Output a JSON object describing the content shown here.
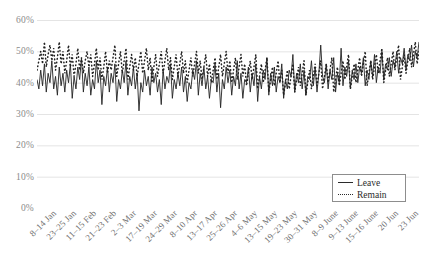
{
  "chart_data": {
    "type": "line",
    "title": "",
    "subtitle": "",
    "xlabel": "",
    "ylabel": "",
    "ylim": [
      0,
      60
    ],
    "y_ticks": [
      "0%",
      "10%",
      "20%",
      "30%",
      "40%",
      "50%",
      "60%"
    ],
    "y_tick_values": [
      0,
      10,
      20,
      30,
      40,
      50,
      60
    ],
    "grid": true,
    "legend_position": "bottom-right",
    "legend": [
      "Leave",
      "Remain"
    ],
    "x_tick_labels": [
      "8–14 Jan",
      "23–25 Jan",
      "11–15 Feb",
      "21–23 Feb",
      "2–3 Mar",
      "17–19 Mar",
      "24–29 Mar",
      "8–10 Apr",
      "13–17 Apr",
      "25–26 Apr",
      "4–6 May",
      "13–15 May",
      "19–23 May",
      "30–31 May",
      "8–9 June",
      "9–13 June",
      "15–16 June",
      "20 Jun",
      "23 Jun"
    ],
    "series": [
      {
        "name": "Leave",
        "style": "solid",
        "color": "#222222",
        "values": [
          41,
          38,
          44,
          39,
          46,
          37,
          43,
          40,
          47,
          38,
          42,
          36,
          45,
          39,
          43,
          37,
          44,
          40,
          46,
          35,
          42,
          38,
          45,
          41,
          48,
          37,
          43,
          39,
          45,
          36,
          41,
          38,
          47,
          40,
          44,
          33,
          42,
          39,
          45,
          37,
          43,
          40,
          46,
          34,
          41,
          38,
          44,
          40,
          47,
          36,
          42,
          39,
          45,
          38,
          43,
          31,
          40,
          37,
          44,
          39,
          42,
          36,
          45,
          40,
          43,
          37,
          41,
          33,
          44,
          38,
          42,
          40,
          46,
          35,
          41,
          38,
          43,
          39,
          45,
          37,
          42,
          34,
          40,
          38,
          44,
          41,
          47,
          36,
          43,
          39,
          45,
          38,
          42,
          35,
          41,
          40,
          46,
          37,
          43,
          32,
          41,
          38,
          45,
          40,
          44,
          36,
          42,
          39,
          47,
          38,
          43,
          35,
          41,
          40,
          45,
          37,
          43,
          39,
          46,
          34,
          42,
          38,
          44,
          41,
          48,
          36,
          43,
          39,
          45,
          37,
          42,
          40,
          46,
          35,
          41,
          38,
          44,
          42,
          49,
          37,
          43,
          40,
          46,
          38,
          44,
          36,
          42,
          41,
          47,
          39,
          45,
          37,
          43,
          52,
          42,
          40,
          46,
          38,
          44,
          41,
          48,
          37,
          43,
          40,
          51,
          39,
          45,
          42,
          47,
          38,
          44,
          41,
          46,
          40,
          45,
          43,
          48,
          39,
          44,
          41,
          47,
          42,
          49,
          40,
          45,
          43,
          50,
          41,
          46,
          44,
          48,
          42,
          47,
          45,
          50,
          43,
          48,
          46,
          51,
          44,
          49,
          47,
          52,
          45,
          50,
          48,
          53
        ]
      },
      {
        "name": "Remain",
        "style": "dotted",
        "color": "#222222",
        "values": [
          44,
          47,
          50,
          46,
          53,
          45,
          49,
          52,
          47,
          51,
          44,
          48,
          53,
          46,
          50,
          43,
          47,
          52,
          45,
          49,
          42,
          46,
          51,
          44,
          48,
          43,
          47,
          50,
          45,
          49,
          42,
          46,
          51,
          44,
          48,
          41,
          45,
          50,
          43,
          47,
          44,
          48,
          52,
          42,
          46,
          50,
          43,
          47,
          51,
          41,
          45,
          49,
          44,
          48,
          42,
          46,
          50,
          43,
          47,
          51,
          44,
          48,
          40,
          45,
          49,
          42,
          46,
          50,
          43,
          47,
          51,
          44,
          48,
          41,
          45,
          49,
          42,
          46,
          50,
          43,
          47,
          40,
          44,
          48,
          42,
          46,
          50,
          43,
          47,
          41,
          45,
          49,
          42,
          46,
          40,
          44,
          48,
          41,
          45,
          49,
          42,
          46,
          50,
          43,
          47,
          40,
          44,
          48,
          41,
          45,
          49,
          42,
          46,
          39,
          43,
          47,
          41,
          45,
          49,
          38,
          42,
          46,
          40,
          44,
          48,
          37,
          41,
          45,
          39,
          43,
          47,
          40,
          44,
          36,
          40,
          44,
          38,
          42,
          46,
          37,
          41,
          45,
          39,
          43,
          47,
          36,
          40,
          44,
          38,
          42,
          46,
          39,
          43,
          47,
          38,
          42,
          46,
          40,
          44,
          48,
          37,
          41,
          45,
          39,
          43,
          47,
          41,
          45,
          49,
          38,
          42,
          46,
          40,
          44,
          48,
          42,
          46,
          50,
          39,
          43,
          47,
          41,
          45,
          49,
          43,
          47,
          51,
          40,
          44,
          48,
          42,
          46,
          50,
          44,
          48,
          52,
          41,
          45,
          49,
          43,
          47,
          51,
          45,
          49,
          53,
          46,
          50
        ]
      }
    ]
  },
  "axis": {
    "baseline_color": "#d9d9d9",
    "gridline_color": "#e4e4e4"
  }
}
